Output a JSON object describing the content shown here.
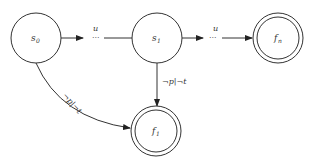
{
  "diagram": {
    "type": "state-machine",
    "nodes": [
      {
        "id": "s0",
        "label": "s",
        "sub": "0",
        "accepting": false
      },
      {
        "id": "s1",
        "label": "s",
        "sub": "1",
        "accepting": false
      },
      {
        "id": "fn",
        "label": "f",
        "sub": "n",
        "accepting": true
      },
      {
        "id": "f1",
        "label": "f",
        "sub": "1",
        "accepting": true
      }
    ],
    "edges": [
      {
        "from": "s0",
        "to": "s1",
        "label": "u",
        "dots": "···"
      },
      {
        "from": "s1",
        "to": "fn",
        "label": "u",
        "dots": "···"
      },
      {
        "from": "s1",
        "to": "f1",
        "label": "¬p|¬t"
      },
      {
        "from": "s0",
        "to": "f1",
        "label": "¬p|¬t"
      }
    ]
  }
}
